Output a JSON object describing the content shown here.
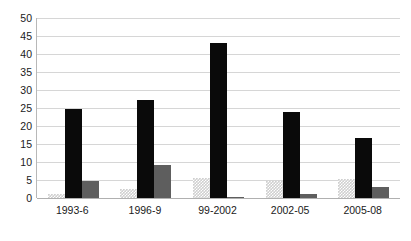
{
  "chart_data": {
    "type": "bar",
    "title": "",
    "subtitle": "",
    "xlabel": "",
    "ylabel": "",
    "categories": [
      "1993-6",
      "1996-9",
      "99-2002",
      "2002-05",
      "2005-08"
    ],
    "series": [
      {
        "name": "series-1",
        "color": "#cfcfcf",
        "pattern": "checkered",
        "values": [
          1.0,
          2.4,
          5.5,
          4.6,
          5.2
        ]
      },
      {
        "name": "series-2",
        "color": "#0a0a0a",
        "pattern": "solid",
        "values": [
          24.8,
          27.3,
          43.0,
          23.8,
          16.8
        ]
      },
      {
        "name": "series-3",
        "color": "#5e5e5e",
        "pattern": "solid",
        "values": [
          4.8,
          9.3,
          0.3,
          1.2,
          3.1
        ]
      }
    ],
    "ylim": [
      0,
      50
    ],
    "yticks": [
      0,
      5,
      10,
      15,
      20,
      25,
      30,
      35,
      40,
      45,
      50
    ],
    "ytick_labels": [
      "0",
      "5",
      "10",
      "15",
      "20",
      "25",
      "30",
      "35",
      "40",
      "45",
      "50"
    ],
    "grid": true,
    "grid_axis": "y",
    "legend": false,
    "legend_position": "none",
    "background": "#ffffff",
    "gridline_color": "#d6d6d6",
    "axis_color": "#b8b8b8"
  }
}
